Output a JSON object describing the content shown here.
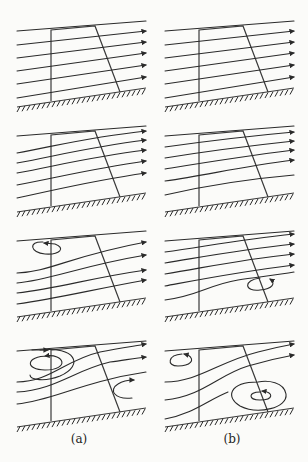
{
  "figure": {
    "columns": [
      {
        "label": "(a)",
        "x_offset": 0
      },
      {
        "label": "(b)",
        "x_offset": 148
      }
    ],
    "rows": [
      {
        "y_offset": 0,
        "description": "straight streamlines, no separation"
      },
      {
        "y_offset": 105,
        "description": "slightly curved streamlines"
      },
      {
        "y_offset": 210,
        "description": "single small eddy"
      },
      {
        "y_offset": 320,
        "description": "two eddies"
      }
    ],
    "panels": [
      {
        "id": "a1",
        "col": 0,
        "row": 0,
        "eddies": []
      },
      {
        "id": "b1",
        "col": 1,
        "row": 0,
        "eddies": []
      },
      {
        "id": "a2",
        "col": 0,
        "row": 1,
        "eddies": []
      },
      {
        "id": "b2",
        "col": 1,
        "row": 1,
        "eddies": []
      },
      {
        "id": "a3",
        "col": 0,
        "row": 2,
        "eddies": [
          {
            "position": "upper-left",
            "direction": "counter-clockwise"
          }
        ]
      },
      {
        "id": "b3",
        "col": 1,
        "row": 2,
        "eddies": [
          {
            "position": "lower-right",
            "direction": "clockwise"
          }
        ]
      },
      {
        "id": "a4",
        "col": 0,
        "row": 3,
        "eddies": [
          {
            "position": "upper-left",
            "direction": "counter-clockwise"
          },
          {
            "position": "lower-right",
            "direction": "clockwise"
          }
        ]
      },
      {
        "id": "b4",
        "col": 1,
        "row": 3,
        "eddies": [
          {
            "position": "upper-left",
            "direction": "counter-clockwise"
          },
          {
            "position": "lower-right",
            "direction": "clockwise"
          }
        ]
      }
    ],
    "colors": {
      "ink": "#2a2a2a",
      "paper": "#fbfbf9"
    }
  }
}
